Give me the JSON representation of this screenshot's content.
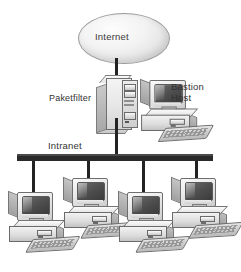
{
  "diagram": {
    "background_color": "#ffffff",
    "line_color": "#232323",
    "nodes": {
      "internet": {
        "label": "Internet",
        "shape": "ellipse",
        "icon": "cloud-oval-icon"
      },
      "paketfilter": {
        "label": "Paketfilter",
        "icon": "tower-pc-icon"
      },
      "bastion_host": {
        "label_line_1": "Bastion",
        "label_line_2": "Host",
        "icon": "desktop-computer-icon"
      },
      "intranet": {
        "label": "Intranet",
        "icon": "bus-bar-icon"
      }
    },
    "clients": [
      {
        "name": "client-1",
        "icon": "desktop-computer-icon"
      },
      {
        "name": "client-2",
        "icon": "desktop-computer-icon"
      },
      {
        "name": "client-3",
        "icon": "desktop-computer-icon"
      },
      {
        "name": "client-4",
        "icon": "desktop-computer-icon"
      }
    ],
    "links": [
      {
        "from": "internet",
        "to": "paketfilter"
      },
      {
        "from": "paketfilter",
        "to": "intranet"
      },
      {
        "from": "intranet",
        "to": "client-1"
      },
      {
        "from": "intranet",
        "to": "client-2"
      },
      {
        "from": "intranet",
        "to": "client-3"
      },
      {
        "from": "intranet",
        "to": "client-4"
      }
    ]
  }
}
